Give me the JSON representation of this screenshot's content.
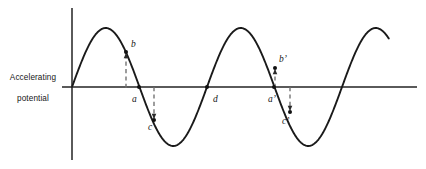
{
  "figure": {
    "axis_caption": "Accelerating\npotential",
    "caption_line_1": "Accelerating",
    "caption_line_2": "potential",
    "stroke_color": "#1a1a1a",
    "axis_color": "#5a5a5a",
    "dash_color": "#6e6e6e",
    "background_color": "#ffffff"
  },
  "chart_data": {
    "type": "line",
    "title": "",
    "xlabel": "",
    "ylabel": "Accelerating potential",
    "grid": false,
    "legend": null,
    "axes": {
      "vertical_axis_x": 72,
      "horizontal_axis_y": 87,
      "vertical_axis_top": 8,
      "vertical_axis_bottom": 160,
      "horizontal_axis_left": 62,
      "horizontal_axis_right": 417
    },
    "waveform": {
      "shape": "sine",
      "amplitude_px": 59,
      "period_px": 135,
      "phase": "starts at origin rising",
      "x_start": 72,
      "x_end": 389,
      "baseline_y": 87,
      "cycles_visible": 2.35,
      "peaks_x": [
        105,
        240,
        375
      ],
      "troughs_x": [
        172,
        307
      ],
      "zero_crossings_x": [
        72,
        139,
        207,
        274,
        341
      ]
    },
    "series": [
      {
        "name": "accelerating potential",
        "description": "sinusoidal accelerating potential versus time"
      }
    ],
    "annotations": [
      {
        "id": "b",
        "label": "b",
        "label_x": 131,
        "label_y": 47,
        "dot_x": 126,
        "dot_y": 52,
        "leader": {
          "from_x": 126,
          "from_y": 88,
          "to_x": 126,
          "to_y": 54,
          "arrow": "up"
        }
      },
      {
        "id": "a",
        "label": "a",
        "label_x": 132,
        "label_y": 102,
        "dot_x": 139,
        "dot_y": 87,
        "leader": null
      },
      {
        "id": "c",
        "label": "c",
        "label_x": 148,
        "label_y": 130,
        "dot_x": 154,
        "dot_y": 120,
        "leader": {
          "from_x": 154,
          "from_y": 87,
          "to_x": 154,
          "to_y": 118,
          "arrow": "down"
        }
      },
      {
        "id": "d",
        "label": "d",
        "label_x": 213,
        "label_y": 102,
        "dot_x": 207,
        "dot_y": 87,
        "leader": null
      },
      {
        "id": "b-prime",
        "label": "b’",
        "label_x": 279,
        "label_y": 62,
        "dot_x": 275,
        "dot_y": 68,
        "leader": {
          "from_x": 275,
          "from_y": 88,
          "to_x": 275,
          "to_y": 70,
          "arrow": "up"
        }
      },
      {
        "id": "a-prime",
        "label": "a’",
        "label_x": 268,
        "label_y": 102,
        "dot_x": 274,
        "dot_y": 87,
        "leader": null
      },
      {
        "id": "c-prime",
        "label": "c’",
        "label_x": 282,
        "label_y": 124,
        "dot_x": 290,
        "dot_y": 112,
        "leader": {
          "from_x": 290,
          "from_y": 87,
          "to_x": 290,
          "to_y": 110,
          "arrow": "down"
        }
      }
    ]
  }
}
